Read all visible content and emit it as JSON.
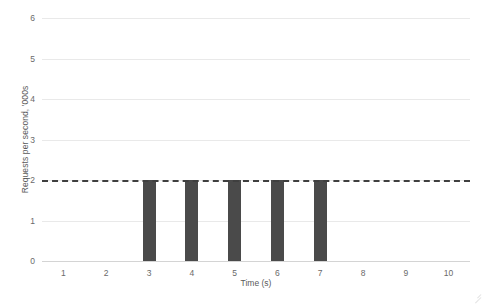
{
  "chart_data": {
    "type": "bar",
    "title": "",
    "xlabel": "Time (s)",
    "ylabel": "Requests per second, '000s",
    "categories": [
      1,
      2,
      3,
      4,
      5,
      6,
      7,
      8,
      9,
      10
    ],
    "xtick_labels": [
      "1",
      "2",
      "3",
      "4",
      "5",
      "6",
      "7",
      "8",
      "9",
      "10"
    ],
    "values": [
      0,
      0,
      2,
      2,
      2,
      2,
      2,
      0,
      0,
      0
    ],
    "ylim": [
      0,
      6
    ],
    "xlim": [
      0.5,
      10.5
    ],
    "ytick_labels": [
      "0",
      "1",
      "2",
      "3",
      "4",
      "5",
      "6"
    ],
    "yticks": [
      0,
      1,
      2,
      3,
      4,
      5,
      6
    ],
    "grid": true,
    "legend": false,
    "legend_position": "none",
    "bar_color": "#4a4a4a",
    "gridline_color": "#e9e9e9",
    "axis_color": "#d4d4d4",
    "text_color": "#6a6a6a",
    "annotations": [
      {
        "name": "threshold-line",
        "type": "hline",
        "value": 2,
        "style": "dashed",
        "color": "#3f3f3f",
        "label": ""
      }
    ]
  }
}
